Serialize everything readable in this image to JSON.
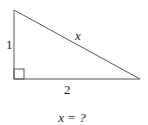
{
  "diagram": {
    "type": "right-triangle",
    "labels": {
      "vertical_leg": "1",
      "horizontal_leg": "2",
      "hypotenuse": "x"
    },
    "question": "x = ?",
    "colors": {
      "stroke": "#555555",
      "text": "#222222"
    }
  }
}
